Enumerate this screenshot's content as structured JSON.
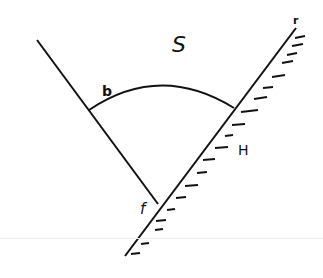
{
  "diagram": {
    "type": "contact-angle sketch",
    "labels": {
      "region": "S",
      "arc": "b",
      "surface": "H",
      "vertex": "f",
      "end": "r"
    },
    "colors": {
      "stroke": "#111111",
      "background": "#ffffff"
    }
  }
}
